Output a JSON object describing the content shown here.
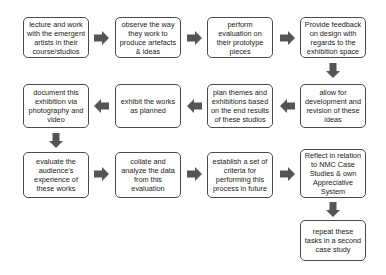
{
  "diagram": {
    "boxes": [
      {
        "id": "b1",
        "text": "lecture and work with the emergent artists in their course/studios"
      },
      {
        "id": "b2",
        "text": "observe the way they work to produce artefacts & ideas"
      },
      {
        "id": "b3",
        "text": "perform evaluation on their prototype pieces"
      },
      {
        "id": "b4",
        "text": "Provide feedback on design with regards to the exhibition space"
      },
      {
        "id": "b5",
        "text": "allow for development and revision of these ideas"
      },
      {
        "id": "b6",
        "text": "plan themes and exhibitions based on the end results of these studios"
      },
      {
        "id": "b7",
        "text": "exhibit the works as planned"
      },
      {
        "id": "b8",
        "text": "document this exhibition via photography and video"
      },
      {
        "id": "b9",
        "text": "evaluate the audience's experience of these works"
      },
      {
        "id": "b10",
        "text": "collate and analyze the data from this evaluation"
      },
      {
        "id": "b11",
        "text": "establish a set of criteria for performing this process in future"
      },
      {
        "id": "b12",
        "text": "Reflect in relation to NMC Case Studies & own Appreciative System"
      },
      {
        "id": "b13",
        "text": "repeat these tasks in a second case study"
      }
    ],
    "arrow_color": "#555555",
    "border_color": "#4a4a4a"
  }
}
